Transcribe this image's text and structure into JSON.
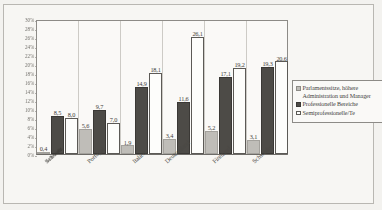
{
  "chart_data": {
    "type": "bar",
    "title": "",
    "xlabel": "",
    "ylabel": "",
    "ylim": [
      0,
      30
    ],
    "ytick_labels": [
      "30%",
      "28%",
      "26%",
      "24%",
      "22%",
      "20%",
      "18%",
      "16%",
      "14%",
      "12%",
      "10%",
      "8%",
      "6%",
      "4%",
      "2%",
      "0%"
    ],
    "grid": false,
    "legend_position": "right",
    "categories": [
      "Schweiz",
      "Portugal",
      "Italien",
      "Deutschland",
      "Finnland",
      "Schweden"
    ],
    "series": [
      {
        "name": "Parlamentssitze, höhere Administration und Manager",
        "color": "#bfbdb8",
        "values": [
          0.4,
          5.6,
          1.9,
          3.4,
          5.2,
          3.1
        ],
        "labels": [
          "0,4",
          "5,6",
          "1,9",
          "3,4",
          "5,2",
          "3,1"
        ]
      },
      {
        "name": "Professionelle Bereiche",
        "color": "#4d4b47",
        "values": [
          8.5,
          9.7,
          14.9,
          11.6,
          17.1,
          19.3
        ],
        "labels": [
          "8,5",
          "9,7",
          "14,9",
          "11,6",
          "17,1",
          "19,3"
        ]
      },
      {
        "name": "Semiprofessionelle/Te",
        "color": "#fdfdfb",
        "values": [
          8.0,
          7.0,
          18.1,
          26.1,
          19.2,
          20.6
        ],
        "labels": [
          "8,0",
          "7,0",
          "18,1",
          "26,1",
          "19,2",
          "20,6"
        ]
      }
    ]
  },
  "legend": {
    "items": [
      "Parlamentssitze, höhere Administration und Manager",
      "Professionelle Bereiche",
      "Semiprofessionelle/Te"
    ]
  }
}
